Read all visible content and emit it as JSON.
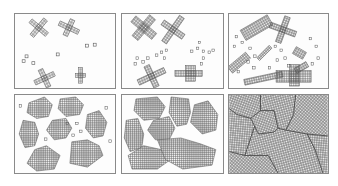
{
  "figure": {
    "panels": [
      {
        "id": 1,
        "stage": "early nucleation",
        "x": 14,
        "y": 13,
        "w": 102,
        "h": 76
      },
      {
        "id": 2,
        "stage": "growth",
        "x": 121,
        "y": 13,
        "w": 103,
        "h": 76
      },
      {
        "id": 3,
        "stage": "more nuclei + growth",
        "x": 228,
        "y": 13,
        "w": 101,
        "h": 76
      },
      {
        "id": 4,
        "stage": "large crystallites",
        "x": 14,
        "y": 94,
        "w": 102,
        "h": 80
      },
      {
        "id": 5,
        "stage": "near impingement",
        "x": 121,
        "y": 94,
        "w": 103,
        "h": 80
      },
      {
        "id": 6,
        "stage": "fully crystallized with grain boundaries",
        "x": 228,
        "y": 94,
        "w": 101,
        "h": 80
      }
    ],
    "colors": {
      "border": "#8a8a8a",
      "lattice": "#555555",
      "fill": "#fdfdfd",
      "boundary": "#333333"
    }
  }
}
